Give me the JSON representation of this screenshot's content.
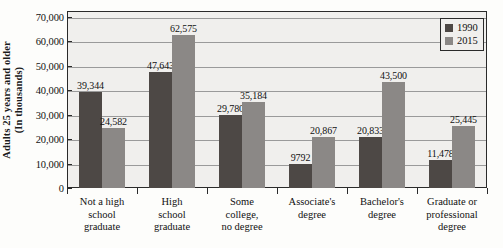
{
  "chart_data": {
    "type": "bar",
    "title": "",
    "xlabel": "",
    "ylabel": "Adults 25 years and older\n(In thousands)",
    "ylabel_line1": "Adults 25 years and older",
    "ylabel_line2": "(In thousands)",
    "ylim": [
      0,
      70000
    ],
    "ytick_step": 10000,
    "grid": true,
    "legend_position": "top-right",
    "categories": [
      "Not a high school graduate",
      "High school graduate",
      "Some college, no degree",
      "Associate's degree",
      "Bachelor's degree",
      "Graduate or professional degree"
    ],
    "category_lines": [
      [
        "Not a high",
        "school",
        "graduate"
      ],
      [
        "High",
        "school",
        "graduate"
      ],
      [
        "Some",
        "college,",
        "no degree"
      ],
      [
        "Associate's",
        "degree"
      ],
      [
        "Bachelor's",
        "degree"
      ],
      [
        "Graduate or",
        "professional",
        "degree"
      ]
    ],
    "series": [
      {
        "name": "1990",
        "color": "#4d4845",
        "values": [
          39344,
          47643,
          29780,
          9792,
          20833,
          11478
        ],
        "value_labels": [
          "39,344",
          "47,643",
          "29,780",
          "9792",
          "20,833",
          "11,478"
        ]
      },
      {
        "name": "2015",
        "color": "#8b8886",
        "values": [
          24582,
          62575,
          35184,
          20867,
          43500,
          25445
        ],
        "value_labels": [
          "24,582",
          "62,575",
          "35,184",
          "20,867",
          "43,500",
          "25,445"
        ]
      }
    ],
    "ytick_labels": [
      "70,000",
      "60,000",
      "50,000",
      "40,000",
      "30,000",
      "20,000",
      "10,000",
      "0"
    ],
    "ytick_values": [
      70000,
      60000,
      50000,
      40000,
      30000,
      20000,
      10000,
      0
    ]
  },
  "legend": {
    "items": [
      {
        "label": "1990",
        "color": "#4d4845"
      },
      {
        "label": "2015",
        "color": "#8b8886"
      }
    ]
  }
}
